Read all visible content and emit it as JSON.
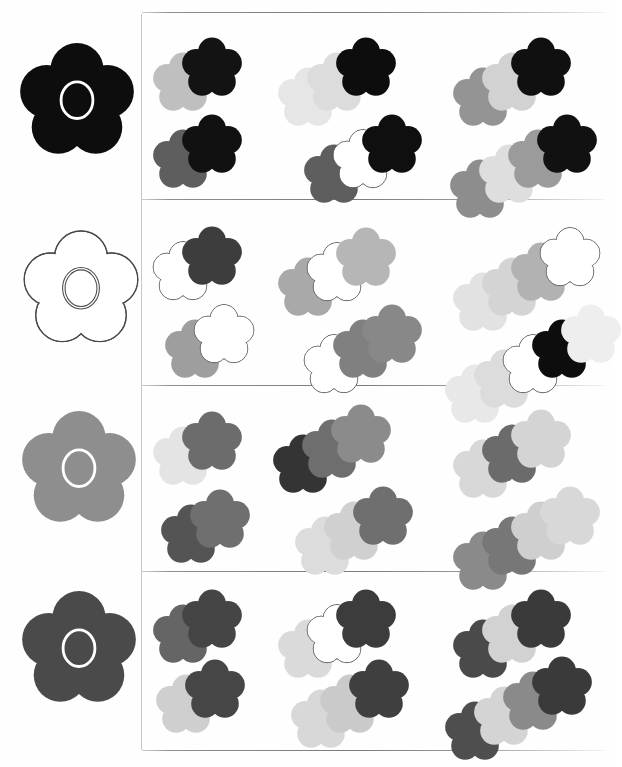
{
  "figure": {
    "background_color": "#ffffff",
    "outline_color": "#4a4a4a",
    "center_ring_color": "#ffffff",
    "rules": {
      "vertical_divider_x": 141,
      "horizontal_rule_color": "#7a7a7a",
      "horizontal_rule_y": [
        12,
        199,
        385,
        571,
        750
      ]
    },
    "palette": {
      "black": "#0d0d0d",
      "near_black": "#1c1c1c",
      "dark_gray": "#4a4a4a",
      "mid_dark_gray": "#5e5e5e",
      "mid_gray": "#7f7f7f",
      "gray": "#949494",
      "light_mid_gray": "#aeaeae",
      "light_gray": "#c6c6c6",
      "pale_gray": "#d9d9d9",
      "very_pale_gray": "#eaeaea",
      "white": "#ffffff"
    }
  },
  "rows": [
    {
      "row_label": "row-1",
      "reference": {
        "name": "reference-flower-black",
        "fill": "#0d0d0d",
        "outlined": false,
        "ring": true,
        "ring_color": "#ffffff"
      },
      "cells": [
        {
          "name": "cluster-r1c1a",
          "x": 152,
          "y": 36,
          "count": 2,
          "flowers": [
            {
              "fill": "#bfbfbf",
              "outlined": false
            },
            {
              "fill": "#131313",
              "outlined": false
            }
          ]
        },
        {
          "name": "cluster-r1c2a",
          "x": 277,
          "y": 36,
          "count": 3,
          "flowers": [
            {
              "fill": "#e6e6e6",
              "outlined": false
            },
            {
              "fill": "#dcdcdc",
              "outlined": false
            },
            {
              "fill": "#0d0d0d",
              "outlined": false
            }
          ]
        },
        {
          "name": "cluster-r1c3a",
          "x": 452,
          "y": 36,
          "count": 3,
          "flowers": [
            {
              "fill": "#949494",
              "outlined": false
            },
            {
              "fill": "#d2d2d2",
              "outlined": false
            },
            {
              "fill": "#101010",
              "outlined": false
            }
          ]
        },
        {
          "name": "cluster-r1c1b",
          "x": 152,
          "y": 113,
          "count": 2,
          "flowers": [
            {
              "fill": "#5e5e5e",
              "outlined": false
            },
            {
              "fill": "#111111",
              "outlined": false
            }
          ]
        },
        {
          "name": "cluster-r1c2b",
          "x": 303,
          "y": 113,
          "count": 3,
          "flowers": [
            {
              "fill": "#5e5e5e",
              "outlined": false
            },
            {
              "fill": "#ffffff",
              "outlined": true
            },
            {
              "fill": "#0f0f0f",
              "outlined": false
            }
          ]
        },
        {
          "name": "cluster-r1c3b",
          "x": 449,
          "y": 113,
          "count": 4,
          "flowers": [
            {
              "fill": "#8d8d8d",
              "outlined": false
            },
            {
              "fill": "#dedede",
              "outlined": false
            },
            {
              "fill": "#9b9b9b",
              "outlined": false
            },
            {
              "fill": "#111111",
              "outlined": false
            }
          ]
        }
      ]
    },
    {
      "row_label": "row-2",
      "reference": {
        "name": "reference-flower-white",
        "fill": "#ffffff",
        "outlined": true,
        "ring": true,
        "ring_color": "#ffffff"
      },
      "cells": [
        {
          "name": "cluster-r2c1a",
          "x": 152,
          "y": 225,
          "count": 2,
          "flowers": [
            {
              "fill": "#ffffff",
              "outlined": true
            },
            {
              "fill": "#3d3d3d",
              "outlined": false
            }
          ]
        },
        {
          "name": "cluster-r2c2a",
          "x": 277,
          "y": 226,
          "count": 3,
          "flowers": [
            {
              "fill": "#a9a9a9",
              "outlined": false
            },
            {
              "fill": "#ffffff",
              "outlined": true
            },
            {
              "fill": "#b6b6b6",
              "outlined": false
            }
          ]
        },
        {
          "name": "cluster-r2c3a",
          "x": 452,
          "y": 226,
          "count": 4,
          "flowers": [
            {
              "fill": "#e2e2e2",
              "outlined": false
            },
            {
              "fill": "#d4d4d4",
              "outlined": false
            },
            {
              "fill": "#b2b2b2",
              "outlined": false
            },
            {
              "fill": "#ffffff",
              "outlined": true
            }
          ]
        },
        {
          "name": "cluster-r2c1b",
          "x": 164,
          "y": 303,
          "count": 2,
          "flowers": [
            {
              "fill": "#9e9e9e",
              "outlined": false
            },
            {
              "fill": "#ffffff",
              "outlined": true
            }
          ]
        },
        {
          "name": "cluster-r2c2b",
          "x": 303,
          "y": 303,
          "count": 3,
          "flowers": [
            {
              "fill": "#ffffff",
              "outlined": true
            },
            {
              "fill": "#808080",
              "outlined": false
            },
            {
              "fill": "#888888",
              "outlined": false
            }
          ]
        },
        {
          "name": "cluster-r2c3b",
          "x": 444,
          "y": 303,
          "count": 5,
          "flowers": [
            {
              "fill": "#e8e8e8",
              "outlined": false
            },
            {
              "fill": "#dcdcdc",
              "outlined": false
            },
            {
              "fill": "#ffffff",
              "outlined": true
            },
            {
              "fill": "#0d0d0d",
              "outlined": false
            },
            {
              "fill": "#eeeeee",
              "outlined": false
            }
          ]
        }
      ]
    },
    {
      "row_label": "row-3",
      "reference": {
        "name": "reference-flower-mid-gray",
        "fill": "#8e8e8e",
        "outlined": false,
        "ring": true,
        "ring_color": "#ffffff"
      },
      "cells": [
        {
          "name": "cluster-r3c1a",
          "x": 152,
          "y": 410,
          "count": 2,
          "flowers": [
            {
              "fill": "#e4e4e4",
              "outlined": false
            },
            {
              "fill": "#6c6c6c",
              "outlined": false
            }
          ]
        },
        {
          "name": "cluster-r3c2a",
          "x": 272,
          "y": 403,
          "count": 3,
          "flowers": [
            {
              "fill": "#343434",
              "outlined": false
            },
            {
              "fill": "#6e6e6e",
              "outlined": false
            },
            {
              "fill": "#8b8b8b",
              "outlined": false
            }
          ]
        },
        {
          "name": "cluster-r3c3a",
          "x": 452,
          "y": 408,
          "count": 3,
          "flowers": [
            {
              "fill": "#d8d8d8",
              "outlined": false
            },
            {
              "fill": "#6b6b6b",
              "outlined": false
            },
            {
              "fill": "#d4d4d4",
              "outlined": false
            }
          ]
        },
        {
          "name": "cluster-r3c1b",
          "x": 160,
          "y": 488,
          "count": 2,
          "flowers": [
            {
              "fill": "#545454",
              "outlined": false
            },
            {
              "fill": "#6f6f6f",
              "outlined": false
            }
          ]
        },
        {
          "name": "cluster-r3c2b",
          "x": 294,
          "y": 485,
          "count": 3,
          "flowers": [
            {
              "fill": "#dcdcdc",
              "outlined": false
            },
            {
              "fill": "#d0d0d0",
              "outlined": false
            },
            {
              "fill": "#6f6f6f",
              "outlined": false
            }
          ]
        },
        {
          "name": "cluster-r3c3b",
          "x": 452,
          "y": 485,
          "count": 4,
          "flowers": [
            {
              "fill": "#8a8a8a",
              "outlined": false
            },
            {
              "fill": "#777777",
              "outlined": false
            },
            {
              "fill": "#cfcfcf",
              "outlined": false
            },
            {
              "fill": "#d8d8d8",
              "outlined": false
            }
          ]
        }
      ]
    },
    {
      "row_label": "row-4",
      "reference": {
        "name": "reference-flower-dark-gray",
        "fill": "#4a4a4a",
        "outlined": false,
        "ring": true,
        "ring_color": "#ffffff"
      },
      "cells": [
        {
          "name": "cluster-r4c1a",
          "x": 152,
          "y": 588,
          "count": 2,
          "flowers": [
            {
              "fill": "#656565",
              "outlined": false
            },
            {
              "fill": "#454545",
              "outlined": false
            }
          ]
        },
        {
          "name": "cluster-r4c2a",
          "x": 277,
          "y": 588,
          "count": 3,
          "flowers": [
            {
              "fill": "#dadada",
              "outlined": false
            },
            {
              "fill": "#ffffff",
              "outlined": true
            },
            {
              "fill": "#3c3c3c",
              "outlined": false
            }
          ]
        },
        {
          "name": "cluster-r4c3a",
          "x": 452,
          "y": 588,
          "count": 3,
          "flowers": [
            {
              "fill": "#4a4a4a",
              "outlined": false
            },
            {
              "fill": "#d2d2d2",
              "outlined": false
            },
            {
              "fill": "#3a3a3a",
              "outlined": false
            }
          ]
        },
        {
          "name": "cluster-r4c1b",
          "x": 155,
          "y": 658,
          "count": 2,
          "flowers": [
            {
              "fill": "#cfcfcf",
              "outlined": false
            },
            {
              "fill": "#464646",
              "outlined": false
            }
          ]
        },
        {
          "name": "cluster-r4c2b",
          "x": 290,
          "y": 658,
          "count": 3,
          "flowers": [
            {
              "fill": "#d8d8d8",
              "outlined": false
            },
            {
              "fill": "#cacaca",
              "outlined": false
            },
            {
              "fill": "#3f3f3f",
              "outlined": false
            }
          ]
        },
        {
          "name": "cluster-r4c3b",
          "x": 444,
          "y": 655,
          "count": 4,
          "flowers": [
            {
              "fill": "#4e4e4e",
              "outlined": false
            },
            {
              "fill": "#d4d4d4",
              "outlined": false
            },
            {
              "fill": "#8a8a8a",
              "outlined": false
            },
            {
              "fill": "#3a3a3a",
              "outlined": false
            }
          ]
        }
      ]
    }
  ],
  "reference_positions": [
    {
      "x": 18,
      "y": 40
    },
    {
      "x": 22,
      "y": 228
    },
    {
      "x": 20,
      "y": 408
    },
    {
      "x": 20,
      "y": 588
    }
  ],
  "geometry": {
    "flower_size": 62,
    "step_x": 29,
    "step_y": -15,
    "rule_left": 142,
    "rule_right": 604
  }
}
